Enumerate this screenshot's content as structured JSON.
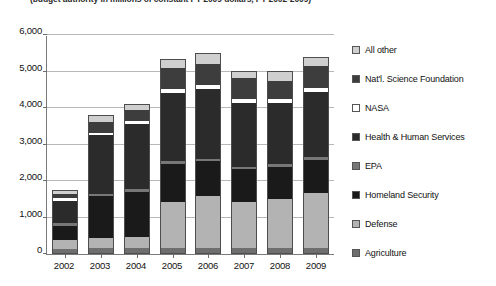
{
  "chart_data": {
    "type": "bar",
    "stacked": true,
    "title": "(budget authority in millions of constant FY 2009 dollars, FY 2002-2009)",
    "xlabel": "",
    "ylabel": "",
    "categories": [
      "2002",
      "2003",
      "2004",
      "2005",
      "2006",
      "2007",
      "2008",
      "2009"
    ],
    "ylim": [
      0,
      6000
    ],
    "yticks": [
      0,
      1000,
      2000,
      3000,
      4000,
      5000,
      6000
    ],
    "ytick_labels": [
      "0",
      "1,000",
      "2,000",
      "3,000",
      "4,000",
      "5,000",
      "6,000"
    ],
    "grid": true,
    "legend_position": "right",
    "series": [
      {
        "name": "Agriculture",
        "color": "#6e6e6e",
        "values": [
          120,
          140,
          150,
          145,
          150,
          140,
          140,
          150
        ]
      },
      {
        "name": "Defense",
        "color": "#b3b3b3",
        "values": [
          230,
          260,
          300,
          1260,
          1400,
          1250,
          1350,
          1500
        ]
      },
      {
        "name": "Homeland Security",
        "color": "#1a1a1a",
        "values": [
          390,
          1150,
          1230,
          1030,
          960,
          900,
          880,
          900
        ]
      },
      {
        "name": "EPA",
        "color": "#777777",
        "values": [
          75,
          80,
          80,
          80,
          80,
          75,
          70,
          70
        ]
      },
      {
        "name": "Health & Human Services",
        "color": "#2b2b2b",
        "values": [
          620,
          1600,
          1770,
          1870,
          1900,
          1750,
          1660,
          1790
        ]
      },
      {
        "name": "NASA",
        "color": "#ffffff",
        "values": [
          60,
          70,
          80,
          110,
          120,
          110,
          110,
          120
        ]
      },
      {
        "name": "Nat'l. Science Foundation",
        "color": "#3d3d3d",
        "values": [
          110,
          290,
          300,
          580,
          580,
          560,
          500,
          600
        ]
      },
      {
        "name": "All other",
        "color": "#cfcfcf",
        "values": [
          95,
          160,
          140,
          225,
          260,
          165,
          240,
          220
        ]
      }
    ],
    "totals": [
      1700,
      3750,
      4050,
      5300,
      5450,
      4950,
      4950,
      5350
    ]
  },
  "legend": {
    "items": [
      {
        "label": "All other",
        "color": "#cfcfcf"
      },
      {
        "label": "Nat'l. Science Foundation",
        "color": "#3d3d3d"
      },
      {
        "label": "NASA",
        "color": "#ffffff"
      },
      {
        "label": "Health & Human Services",
        "color": "#2b2b2b"
      },
      {
        "label": "EPA",
        "color": "#777777"
      },
      {
        "label": "Homeland Security",
        "color": "#1a1a1a"
      },
      {
        "label": "Defense",
        "color": "#b3b3b3"
      },
      {
        "label": "Agriculture",
        "color": "#6e6e6e"
      }
    ]
  }
}
